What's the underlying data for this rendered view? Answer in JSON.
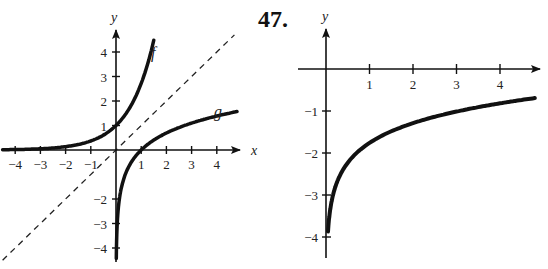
{
  "problem_number": "47.",
  "chart_data": [
    {
      "type": "line",
      "title": "",
      "xlabel": "x",
      "ylabel": "y",
      "xlim": [
        -4.5,
        5
      ],
      "ylim": [
        -4.5,
        4.7
      ],
      "grid": false,
      "x_ticks": [
        -4,
        -3,
        -2,
        -1,
        1,
        2,
        3,
        4
      ],
      "y_ticks": [
        -4,
        -3,
        -2,
        1,
        2,
        3,
        4
      ],
      "x_tick_labels": [
        "−4",
        "−3",
        "−2",
        "−1",
        "1",
        "2",
        "3",
        "4"
      ],
      "y_tick_labels": [
        "−4",
        "−3",
        "−2",
        "1",
        "2",
        "3",
        "4"
      ],
      "series": [
        {
          "name": "f",
          "style": "solid",
          "description": "exponential curve y = e^x",
          "x": [
            -4.5,
            -3,
            -2,
            -1,
            0,
            0.5,
            1,
            1.5
          ],
          "y": [
            0.01,
            0.05,
            0.14,
            0.37,
            1.0,
            1.65,
            2.72,
            4.48
          ]
        },
        {
          "name": "g",
          "style": "solid",
          "description": "logarithmic curve y = ln x",
          "x": [
            0.01,
            0.05,
            0.14,
            0.37,
            1,
            2,
            3,
            4,
            4.8
          ],
          "y": [
            -4.6,
            -3.0,
            -2.0,
            -1.0,
            0.0,
            0.69,
            1.1,
            1.39,
            1.57
          ]
        },
        {
          "name": "y = x",
          "style": "dashed",
          "description": "line of symmetry",
          "x": [
            -4.5,
            4.7
          ],
          "y": [
            -4.5,
            4.7
          ]
        }
      ],
      "annotations": [
        {
          "text": "f",
          "x": 1.45,
          "y": 4.1
        },
        {
          "text": "g",
          "x": 4.1,
          "y": 1.9
        }
      ]
    },
    {
      "type": "line",
      "title": "47.",
      "xlabel": "x",
      "ylabel": "y",
      "xlim": [
        -0.9,
        5
      ],
      "ylim": [
        -4.5,
        1.1
      ],
      "grid": false,
      "x_ticks": [
        1,
        2,
        3,
        4
      ],
      "y_ticks": [
        -1,
        -2,
        -3,
        -4
      ],
      "x_tick_labels": [
        "1",
        "2",
        "3",
        "4"
      ],
      "y_tick_labels": [
        "−1",
        "−2",
        "−3",
        "−4"
      ],
      "series": [
        {
          "name": "curve",
          "style": "solid",
          "description": "logarithmic curve, vertical asymptote at x = 0",
          "x": [
            0.05,
            0.1,
            0.25,
            0.5,
            1,
            2,
            3,
            4,
            4.8
          ],
          "y": [
            -4.4,
            -3.6,
            -2.8,
            -2.25,
            -1.76,
            -1.29,
            -1.02,
            -0.74,
            -0.57
          ]
        }
      ]
    }
  ]
}
